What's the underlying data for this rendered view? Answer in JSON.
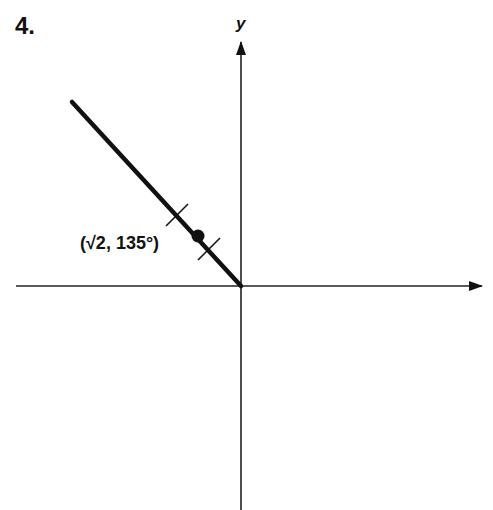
{
  "problem_number": "4.",
  "axes": {
    "x_label": "",
    "y_label": "y",
    "origin_px": [
      241,
      286
    ]
  },
  "ray": {
    "angle_deg": 135,
    "from_px": [
      241,
      286
    ],
    "to_px": [
      72,
      102
    ],
    "description": "Ray from origin at angle 135 degrees"
  },
  "point": {
    "label": "(√2, 135°)",
    "r": "√2",
    "theta": "135°",
    "px": [
      198,
      236
    ]
  },
  "tick_marks": [
    {
      "px": [
        177,
        215
      ]
    },
    {
      "px": [
        209,
        249
      ]
    }
  ]
}
